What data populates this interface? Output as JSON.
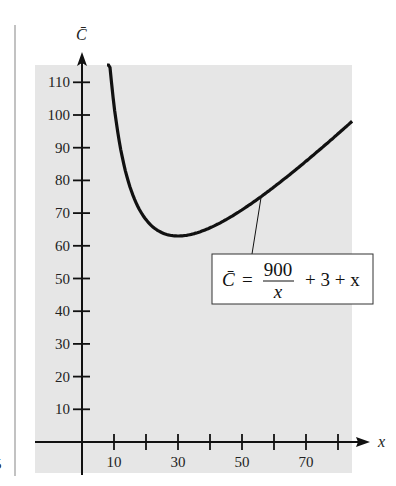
{
  "chart_data": {
    "type": "line",
    "title": "",
    "xlabel": "x",
    "ylabel": "C̄",
    "xlim": [
      -14,
      88
    ],
    "ylim": [
      0,
      118
    ],
    "x_ticks": [
      10,
      20,
      30,
      40,
      50,
      60,
      70,
      80
    ],
    "x_tick_labels": [
      "10",
      "",
      "30",
      "",
      "50",
      "",
      "70",
      ""
    ],
    "y_ticks": [
      10,
      20,
      30,
      40,
      50,
      60,
      70,
      80,
      90,
      100,
      110
    ],
    "y_tick_labels": [
      "10",
      "20",
      "30",
      "40",
      "50",
      "60",
      "70",
      "80",
      "90",
      "100",
      "110"
    ],
    "grid": false,
    "series": [
      {
        "name": "C̄ = 900/x + 3 + x",
        "function": "900/x + 3 + x",
        "x_range": [
          7.8,
          84.4
        ],
        "sample_points": [
          {
            "x": 10,
            "y": 103
          },
          {
            "x": 20,
            "y": 68
          },
          {
            "x": 30,
            "y": 63
          },
          {
            "x": 40,
            "y": 65.5
          },
          {
            "x": 50,
            "y": 71
          },
          {
            "x": 60,
            "y": 78
          },
          {
            "x": 70,
            "y": 85.9
          },
          {
            "x": 80,
            "y": 94.25
          }
        ]
      }
    ],
    "annotation": {
      "lhs": "C̄",
      "equals": "=",
      "numerator": "900",
      "denominator": "x",
      "rest": "+ 3 + x",
      "points_to_x": 56
    }
  },
  "margin_mark": "5",
  "colors": {
    "panel": "#e6e6e6",
    "ink": "#111111",
    "box_fill": "#ffffff"
  }
}
